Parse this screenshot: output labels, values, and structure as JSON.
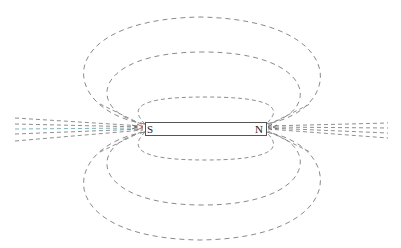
{
  "diagram": {
    "magnet": {
      "south_label": "S",
      "north_label": "N",
      "outline_color": "#555555"
    },
    "field_lines": {
      "style": "dashed",
      "color": "#8a8a8a",
      "loops": [
        {
          "name": "inner-loop",
          "cx": 205,
          "cy": 128,
          "rx": 70,
          "ry": 31
        },
        {
          "name": "middle-loop",
          "cx": 203,
          "cy": 128,
          "rx": 103,
          "ry": 76
        },
        {
          "name": "outer-loop",
          "cx": 200,
          "cy": 128,
          "rx": 127,
          "ry": 111
        }
      ],
      "axial_lines_per_side": 5
    }
  }
}
